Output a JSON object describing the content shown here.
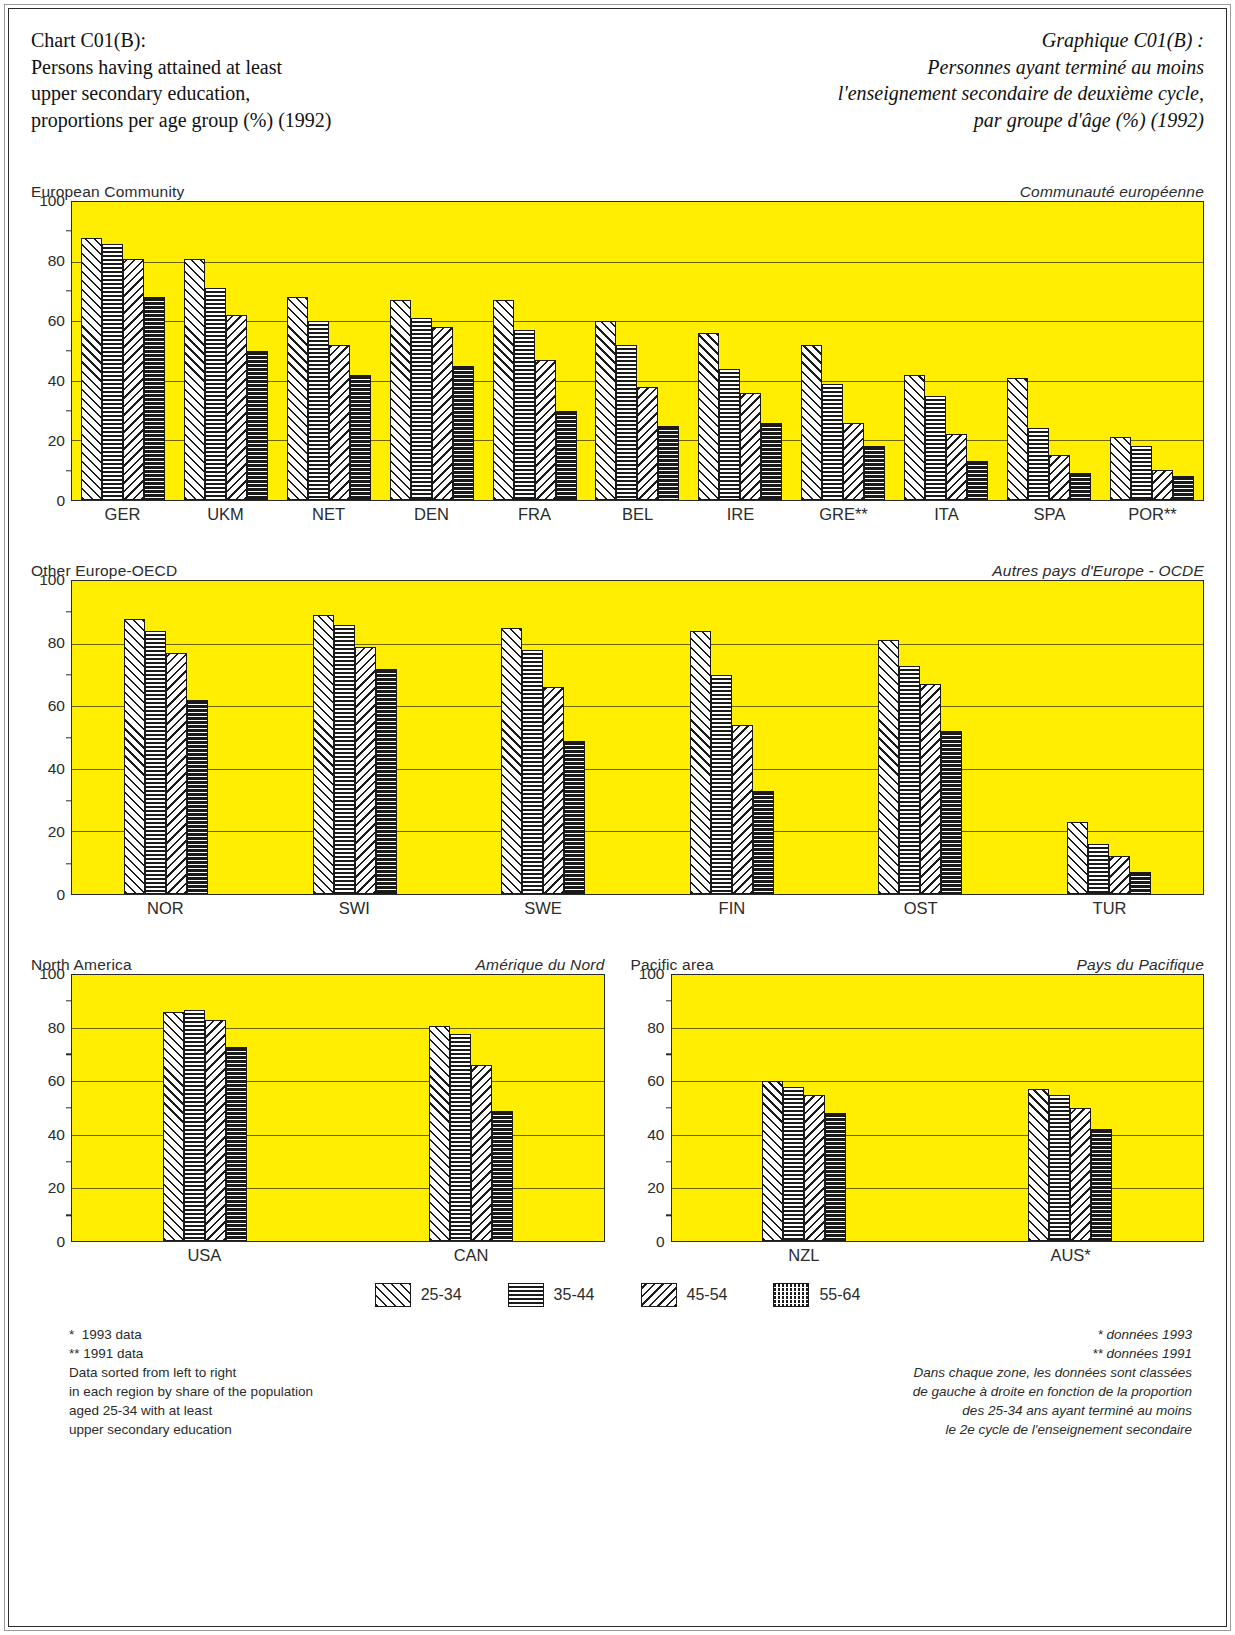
{
  "title": {
    "en": [
      "Chart C01(B):",
      "Persons having attained at least",
      "upper secondary education,",
      "proportions per age group (%) (1992)"
    ],
    "fr": [
      "Graphique C01(B) :",
      "Personnes ayant terminé au moins",
      "l'enseignement secondaire de deuxième cycle,",
      "par groupe d'âge (%) (1992)"
    ]
  },
  "axis": {
    "ticks": [
      "100",
      "80",
      "60",
      "40",
      "20",
      "0"
    ],
    "values": [
      100,
      80,
      60,
      40,
      20,
      0
    ],
    "minor": [
      90,
      70,
      50,
      30,
      10
    ],
    "ymin": 0,
    "ymax": 100
  },
  "legend": {
    "items": [
      {
        "label": "25-34",
        "pattern": "p-2534"
      },
      {
        "label": "35-44",
        "pattern": "p-3544"
      },
      {
        "label": "45-54",
        "pattern": "p-4554"
      },
      {
        "label": "55-64",
        "pattern": "p-5564"
      }
    ]
  },
  "notes": {
    "en": [
      "*  1993 data",
      "** 1991 data",
      "Data sorted from left to right",
      "in each region by share of the population",
      "aged 25-34 with at least",
      "upper secondary education"
    ],
    "fr": [
      "* données 1993",
      "** données 1991",
      "Dans chaque zone, les données sont classées",
      "de gauche à droite en fonction de la proportion",
      "des 25-34 ans ayant terminé au moins",
      "le 2e cycle de l'enseignement secondaire"
    ]
  },
  "colors": {
    "plot_background": "#ffee00",
    "ink": "#1a1a1a",
    "gridline": "#6b6200"
  },
  "chart_data": [
    {
      "id": "european-community",
      "type": "bar",
      "title": "European Community",
      "title_fr": "Communauté européenne",
      "xlabel": "",
      "ylabel": "",
      "ylim": [
        0,
        100
      ],
      "grid": true,
      "legend_position": "bottom-shared",
      "categories": [
        "GER",
        "UKM",
        "NET",
        "DEN",
        "FRA",
        "BEL",
        "IRE",
        "GRE**",
        "ITA",
        "SPA",
        "POR**"
      ],
      "series": [
        {
          "name": "25-34",
          "values": [
            88,
            81,
            68,
            67,
            67,
            60,
            56,
            52,
            42,
            41,
            21
          ]
        },
        {
          "name": "35-44",
          "values": [
            86,
            71,
            60,
            61,
            57,
            52,
            44,
            39,
            35,
            24,
            18
          ]
        },
        {
          "name": "45-54",
          "values": [
            81,
            62,
            52,
            58,
            47,
            38,
            36,
            26,
            22,
            15,
            10
          ]
        },
        {
          "name": "55-64",
          "values": [
            68,
            50,
            42,
            45,
            30,
            25,
            26,
            18,
            13,
            9,
            8
          ]
        }
      ]
    },
    {
      "id": "other-europe-oecd",
      "type": "bar",
      "title": "Other Europe-OECD",
      "title_fr": "Autres pays d'Europe  - OCDE",
      "xlabel": "",
      "ylabel": "",
      "ylim": [
        0,
        100
      ],
      "grid": true,
      "legend_position": "bottom-shared",
      "categories": [
        "NOR",
        "SWI",
        "SWE",
        "FIN",
        "OST",
        "TUR"
      ],
      "series": [
        {
          "name": "25-34",
          "values": [
            88,
            89,
            85,
            84,
            81,
            23
          ]
        },
        {
          "name": "35-44",
          "values": [
            84,
            86,
            78,
            70,
            73,
            16
          ]
        },
        {
          "name": "45-54",
          "values": [
            77,
            79,
            66,
            54,
            67,
            12
          ]
        },
        {
          "name": "55-64",
          "values": [
            62,
            72,
            49,
            33,
            52,
            7
          ]
        }
      ]
    },
    {
      "id": "north-america",
      "type": "bar",
      "title": "North America",
      "title_fr": "Amérique du Nord",
      "xlabel": "",
      "ylabel": "",
      "ylim": [
        0,
        100
      ],
      "grid": true,
      "legend_position": "bottom-shared",
      "categories": [
        "USA",
        "CAN"
      ],
      "series": [
        {
          "name": "25-34",
          "values": [
            86,
            81
          ]
        },
        {
          "name": "35-44",
          "values": [
            87,
            78
          ]
        },
        {
          "name": "45-54",
          "values": [
            83,
            66
          ]
        },
        {
          "name": "55-64",
          "values": [
            73,
            49
          ]
        }
      ]
    },
    {
      "id": "pacific-area",
      "type": "bar",
      "title": "Pacific area",
      "title_fr": "Pays du Pacifique",
      "xlabel": "",
      "ylabel": "",
      "ylim": [
        0,
        100
      ],
      "grid": true,
      "legend_position": "bottom-shared",
      "categories": [
        "NZL",
        "AUS*"
      ],
      "series": [
        {
          "name": "25-34",
          "values": [
            60,
            57
          ]
        },
        {
          "name": "35-44",
          "values": [
            58,
            55
          ]
        },
        {
          "name": "45-54",
          "values": [
            55,
            50
          ]
        },
        {
          "name": "55-64",
          "values": [
            48,
            42
          ]
        }
      ]
    }
  ]
}
